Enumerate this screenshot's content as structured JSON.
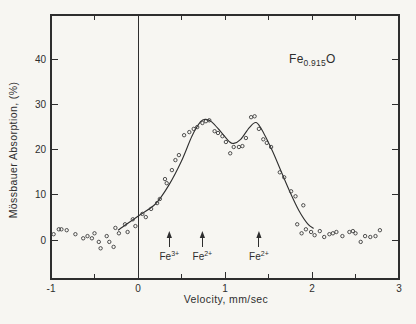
{
  "chart_data": {
    "type": "scatter",
    "xlabel": "Velocity, mm/sec",
    "ylabel": "Mössbauer Absorption, (%)",
    "sample_label": {
      "prefix": "Fe",
      "subscript": "0.915",
      "suffix": "O"
    },
    "x_range": [
      -1,
      3
    ],
    "y_range": [
      -8.6,
      49.8
    ],
    "grid": "off",
    "legend": "none",
    "x_major_ticks": [
      [
        -1,
        "-1"
      ],
      [
        0,
        "0"
      ],
      [
        1,
        "1"
      ],
      [
        2,
        "2"
      ],
      [
        3,
        "3"
      ]
    ],
    "x_minor_ticks": [
      -0.5,
      0.5,
      1.5,
      2.5
    ],
    "x_top_ticks": [
      -0.5,
      0.5,
      1.0,
      1.5,
      2.0,
      2.5
    ],
    "y_major_ticks": [
      [
        0,
        "0"
      ],
      [
        10,
        "10"
      ],
      [
        20,
        "20"
      ],
      [
        30,
        "30"
      ],
      [
        40,
        "40"
      ]
    ],
    "zero_line_x": 0,
    "series": [
      {
        "name": "measured-points",
        "marker": "open-circle",
        "points": [
          [
            -0.97,
            1.3
          ],
          [
            -0.91,
            2.4
          ],
          [
            -0.88,
            2.4
          ],
          [
            -0.82,
            2.2
          ],
          [
            -0.72,
            1.3
          ],
          [
            -0.63,
            0.4
          ],
          [
            -0.58,
            0.9
          ],
          [
            -0.53,
            0.4
          ],
          [
            -0.5,
            1.5
          ],
          [
            -0.45,
            -0.4
          ],
          [
            -0.43,
            -1.8
          ],
          [
            -0.36,
            0.9
          ],
          [
            -0.33,
            -0.4
          ],
          [
            -0.28,
            -1.5
          ],
          [
            -0.26,
            2.7
          ],
          [
            -0.22,
            1.5
          ],
          [
            -0.15,
            3.5
          ],
          [
            -0.12,
            1.8
          ],
          [
            -0.06,
            4.6
          ],
          [
            -0.03,
            3.1
          ],
          [
            0.05,
            5.8
          ],
          [
            0.09,
            5.1
          ],
          [
            0.15,
            6.9
          ],
          [
            0.22,
            8.2
          ],
          [
            0.25,
            9.1
          ],
          [
            0.31,
            13.5
          ],
          [
            0.33,
            12.6
          ],
          [
            0.39,
            15.5
          ],
          [
            0.43,
            17.7
          ],
          [
            0.47,
            18.8
          ],
          [
            0.53,
            23.2
          ],
          [
            0.59,
            23.9
          ],
          [
            0.64,
            24.6
          ],
          [
            0.68,
            25.0
          ],
          [
            0.74,
            25.9
          ],
          [
            0.78,
            26.3
          ],
          [
            0.82,
            26.5
          ],
          [
            0.88,
            24.1
          ],
          [
            0.92,
            23.7
          ],
          [
            0.97,
            23.0
          ],
          [
            1.01,
            21.7
          ],
          [
            1.06,
            19.2
          ],
          [
            1.1,
            20.6
          ],
          [
            1.16,
            20.6
          ],
          [
            1.2,
            20.8
          ],
          [
            1.24,
            22.6
          ],
          [
            1.3,
            27.2
          ],
          [
            1.34,
            27.4
          ],
          [
            1.39,
            24.6
          ],
          [
            1.44,
            22.3
          ],
          [
            1.48,
            21.5
          ],
          [
            1.53,
            20.6
          ],
          [
            1.63,
            15.0
          ],
          [
            1.68,
            13.9
          ],
          [
            1.76,
            10.8
          ],
          [
            1.81,
            9.7
          ],
          [
            1.9,
            7.7
          ],
          [
            1.83,
            3.5
          ],
          [
            1.88,
            1.5
          ],
          [
            1.93,
            2.4
          ],
          [
            1.99,
            1.8
          ],
          [
            2.03,
            1.1
          ],
          [
            2.09,
            2.0
          ],
          [
            2.14,
            0.7
          ],
          [
            2.2,
            1.3
          ],
          [
            2.24,
            1.5
          ],
          [
            2.28,
            1.8
          ],
          [
            2.35,
            0.9
          ],
          [
            2.43,
            1.8
          ],
          [
            2.47,
            2.0
          ],
          [
            2.5,
            1.5
          ],
          [
            2.56,
            -0.4
          ],
          [
            2.61,
            0.9
          ],
          [
            2.67,
            0.7
          ],
          [
            2.73,
            0.9
          ],
          [
            2.78,
            2.2
          ]
        ]
      },
      {
        "name": "fitted-curve",
        "marker": "none",
        "points": [
          [
            -0.23,
            2.2
          ],
          [
            0.0,
            5.3
          ],
          [
            0.2,
            8.0
          ],
          [
            0.35,
            12.0
          ],
          [
            0.5,
            17.5
          ],
          [
            0.62,
            23.0
          ],
          [
            0.72,
            26.2
          ],
          [
            0.78,
            26.7
          ],
          [
            0.85,
            26.1
          ],
          [
            0.95,
            24.0
          ],
          [
            1.05,
            21.8
          ],
          [
            1.1,
            21.4
          ],
          [
            1.18,
            22.3
          ],
          [
            1.28,
            24.9
          ],
          [
            1.36,
            26.0
          ],
          [
            1.45,
            23.5
          ],
          [
            1.55,
            19.5
          ],
          [
            1.65,
            15.0
          ],
          [
            1.75,
            10.5
          ],
          [
            1.85,
            6.5
          ],
          [
            1.95,
            3.6
          ],
          [
            2.02,
            2.6
          ]
        ]
      }
    ],
    "annotations": [
      {
        "text": "Fe",
        "sup": "3+",
        "x": 0.36
      },
      {
        "text": "Fe",
        "sup": "2+",
        "x": 0.74
      },
      {
        "text": "Fe",
        "sup": "2+",
        "x": 1.39
      }
    ],
    "ink_color": "#2e2e2e",
    "paper_color": "#f7f6f2"
  }
}
